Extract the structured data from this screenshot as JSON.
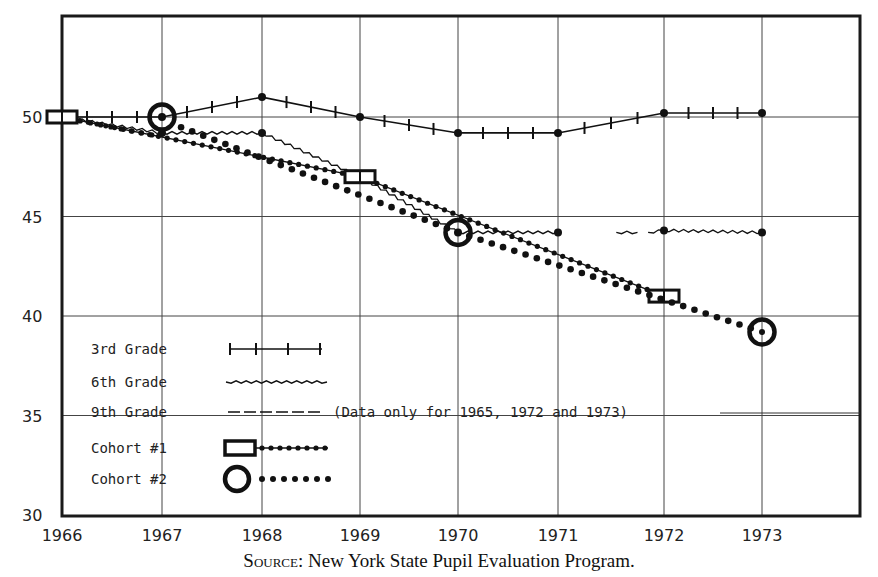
{
  "chart_data": {
    "type": "line",
    "title": "",
    "xlabel": "",
    "ylabel": "",
    "x": [
      1966,
      1967,
      1968,
      1969,
      1970,
      1971,
      1972,
      1973
    ],
    "x_tick_labels": [
      "1966",
      "1967",
      "1968",
      "1969",
      "1970",
      "1971",
      "1972",
      "1973"
    ],
    "y_tick_labels": [
      "50",
      "45",
      "40",
      "35",
      "30"
    ],
    "ylim": [
      30,
      55
    ],
    "xlim": [
      1966,
      1974
    ],
    "grid": true,
    "legend_position": "lower-left inside",
    "series": [
      {
        "name": "3rd Grade",
        "style": "solid line with cross ticks",
        "x": [
          1966,
          1967,
          1968,
          1969,
          1970,
          1971,
          1972,
          1973
        ],
        "values": [
          50,
          50,
          51,
          50,
          49.2,
          49.2,
          50.2,
          50.2
        ]
      },
      {
        "name": "6th Grade",
        "style": "wavy line",
        "x": [
          1966,
          1967,
          1968,
          1969,
          1970,
          1971,
          1972,
          1973
        ],
        "values": [
          50,
          49.2,
          49.2,
          47,
          44.2,
          44.2,
          44.3,
          44.2
        ]
      },
      {
        "name": "9th Grade",
        "style": "dashed line",
        "x": [],
        "values": [],
        "note": "(Data only for 1965, 1972 and 1973)"
      },
      {
        "name": "Cohort #1",
        "style": "square marker with dotted line",
        "x": [
          1966,
          1969,
          1972
        ],
        "values": [
          50,
          47,
          41
        ]
      },
      {
        "name": "Cohort #2",
        "style": "circle marker with dotted line",
        "x": [
          1967,
          1970,
          1973
        ],
        "values": [
          50,
          44.2,
          39.2
        ]
      }
    ],
    "annotations": [
      "(Data only for 1965, 1972 and 1973)"
    ],
    "source": "SOURCE: New York State Pupil Evaluation Program."
  },
  "legend": {
    "items": [
      {
        "label": "3rd Grade"
      },
      {
        "label": "6th Grade"
      },
      {
        "label": "9th Grade"
      },
      {
        "label": "Cohort #1"
      },
      {
        "label": "Cohort #2"
      }
    ],
    "note": "(Data only for 1965, 1972 and 1973)"
  },
  "source": {
    "prefix": "Source",
    "text": ": New York State Pupil Evaluation Program."
  }
}
